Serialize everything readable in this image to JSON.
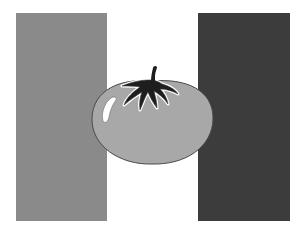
{
  "image": {
    "alt": "Flag with three vertical stripes and a tomato emblem in the center"
  },
  "flag": {
    "stripes": [
      {
        "position": "left",
        "color": "#8a8a8a"
      },
      {
        "position": "center",
        "color": "#ffffff"
      },
      {
        "position": "right",
        "color": "#3c3c3c"
      }
    ]
  },
  "emblem": {
    "name": "tomato",
    "body_color": "#a8a8a8",
    "outline_color": "#4a4a4a",
    "calyx_color": "#1e1e1e",
    "highlight_color": "#ffffff"
  }
}
